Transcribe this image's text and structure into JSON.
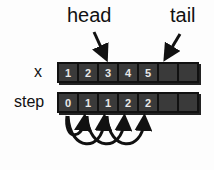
{
  "labels": {
    "head": "head",
    "tail": "tail"
  },
  "rows": {
    "x": {
      "label": "x",
      "cells": [
        "1",
        "2",
        "3",
        "4",
        "5",
        "",
        ""
      ]
    },
    "step": {
      "label": "step",
      "cells": [
        "0",
        "1",
        "1",
        "2",
        "2",
        "",
        ""
      ]
    }
  },
  "arrows": {
    "head_points_to_index": 2,
    "tail_points_to_index": 5
  },
  "arcs": [
    {
      "from": 0,
      "to": 1
    },
    {
      "from": 0,
      "to": 2
    },
    {
      "from": 1,
      "to": 3
    },
    {
      "from": 2,
      "to": 4
    }
  ]
}
